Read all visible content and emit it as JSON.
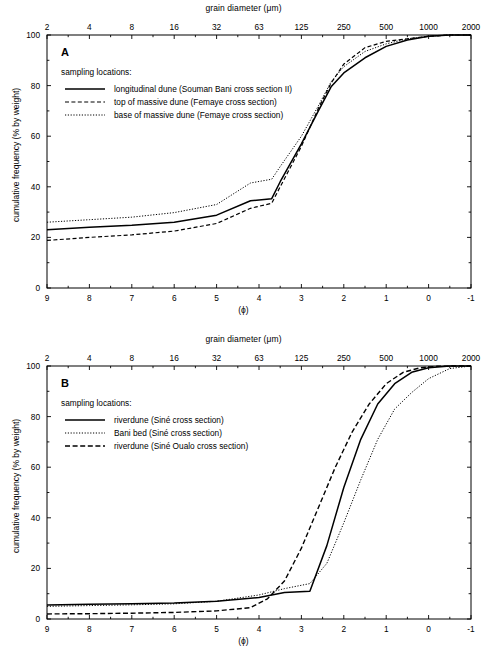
{
  "figure": {
    "top_axis_title": "grain diameter (μm)",
    "bottom_axis_title": "(ϕ)",
    "y_axis_title": "cumulative frequency (% by weight)",
    "legend_header": "sampling locations:"
  },
  "chart_data": [
    {
      "type": "line",
      "panel": "A",
      "title": "grain diameter (μm)",
      "xlabel": "(ϕ)",
      "ylabel": "cumulative frequency (% by weight)",
      "xlim": [
        9,
        -1
      ],
      "ylim": [
        0,
        100
      ],
      "grid": false,
      "legend_position": "upper-left",
      "x_ticks_bottom": [
        "9",
        "8",
        "7",
        "6",
        "5",
        "4",
        "3",
        "2",
        "1",
        "0",
        "-1"
      ],
      "x_ticks_top": [
        "2",
        "4",
        "8",
        "16",
        "32",
        "63",
        "125",
        "250",
        "500",
        "1000",
        "2000"
      ],
      "y_ticks": [
        "0",
        "20",
        "40",
        "60",
        "80",
        "100"
      ],
      "y_minor_ticks": [
        10,
        30,
        50,
        70,
        90
      ],
      "series": [
        {
          "name": "longitudinal dune (Souman Bani cross section II)",
          "style": "solid",
          "x": [
            9.0,
            8.0,
            7.0,
            6.0,
            5.0,
            4.2,
            3.7,
            3.5,
            3.0,
            2.6,
            2.3,
            2.0,
            1.5,
            1.0,
            0.5,
            0.0,
            -0.5,
            -1.0
          ],
          "y": [
            23.0,
            24.0,
            24.8,
            26.0,
            28.8,
            34.5,
            35.3,
            42.0,
            57.0,
            70.0,
            79.5,
            85.0,
            91.0,
            95.5,
            98.0,
            99.5,
            100.0,
            100.0
          ]
        },
        {
          "name": "top of massive dune (Femaye cross section)",
          "style": "dashed",
          "x": [
            9.0,
            8.0,
            7.0,
            6.0,
            5.0,
            4.2,
            3.7,
            3.5,
            3.0,
            2.6,
            2.3,
            2.0,
            1.5,
            1.0,
            0.5,
            0.0,
            -0.5,
            -1.0
          ],
          "y": [
            18.8,
            20.0,
            21.0,
            22.5,
            25.5,
            31.5,
            33.5,
            40.0,
            56.0,
            71.0,
            81.0,
            88.5,
            95.0,
            97.5,
            98.5,
            99.5,
            100.0,
            100.0
          ]
        },
        {
          "name": "base of massive dune (Femaye cross section)",
          "style": "dotted",
          "x": [
            9.0,
            8.0,
            7.0,
            6.0,
            5.0,
            4.2,
            3.7,
            3.5,
            3.0,
            2.6,
            2.3,
            2.0,
            1.5,
            1.0,
            0.5,
            0.0,
            -0.5,
            -1.0
          ],
          "y": [
            26.0,
            27.0,
            28.0,
            29.8,
            33.0,
            41.5,
            43.0,
            48.0,
            60.0,
            72.0,
            81.5,
            87.5,
            93.5,
            96.5,
            98.5,
            99.5,
            100.0,
            100.0
          ]
        }
      ]
    },
    {
      "type": "line",
      "panel": "B",
      "title": "grain diameter (μm)",
      "xlabel": "(ϕ)",
      "ylabel": "cumulative frequency (% by weight)",
      "xlim": [
        9,
        -1
      ],
      "ylim": [
        0,
        100
      ],
      "grid": false,
      "legend_position": "upper-left",
      "x_ticks_bottom": [
        "9",
        "8",
        "7",
        "6",
        "5",
        "4",
        "3",
        "2",
        "1",
        "0",
        "-1"
      ],
      "x_ticks_top": [
        "2",
        "4",
        "8",
        "16",
        "32",
        "63",
        "125",
        "250",
        "500",
        "1000",
        "2000"
      ],
      "y_ticks": [
        "0",
        "20",
        "40",
        "60",
        "80",
        "100"
      ],
      "y_minor_ticks": [
        10,
        30,
        50,
        70,
        90
      ],
      "series": [
        {
          "name": "riverdune (Siné cross section)",
          "style": "solid",
          "x": [
            9.0,
            8.0,
            7.0,
            6.0,
            5.0,
            4.0,
            3.4,
            2.8,
            2.4,
            2.0,
            1.6,
            1.2,
            0.8,
            0.4,
            0.0,
            -0.5,
            -1.0
          ],
          "y": [
            5.5,
            5.8,
            6.0,
            6.3,
            7.0,
            8.5,
            10.5,
            11.0,
            29.0,
            52.0,
            71.0,
            85.0,
            93.0,
            97.5,
            99.3,
            100.0,
            100.0
          ]
        },
        {
          "name": "Bani bed (Siné cross section)",
          "style": "dotted",
          "x": [
            9.0,
            8.0,
            7.0,
            6.0,
            5.0,
            4.0,
            3.4,
            2.8,
            2.4,
            2.0,
            1.6,
            1.2,
            0.8,
            0.4,
            0.0,
            -0.5,
            -1.0
          ],
          "y": [
            5.0,
            5.3,
            5.6,
            6.0,
            7.0,
            9.5,
            12.0,
            14.0,
            22.0,
            38.0,
            55.0,
            71.0,
            83.0,
            89.5,
            95.0,
            99.0,
            100.0
          ]
        },
        {
          "name": "riverdune (Siné Oualo cross section)",
          "style": "dashed-long",
          "x": [
            9.0,
            8.0,
            7.0,
            6.0,
            5.0,
            4.2,
            3.8,
            3.4,
            3.0,
            2.6,
            2.2,
            1.8,
            1.4,
            1.0,
            0.6,
            0.2,
            -0.2,
            -0.6,
            -1.0
          ],
          "y": [
            2.0,
            2.1,
            2.3,
            2.6,
            3.2,
            4.5,
            8.0,
            15.0,
            28.0,
            44.0,
            60.0,
            74.0,
            85.0,
            93.0,
            97.5,
            99.3,
            99.9,
            100.0,
            100.0
          ]
        }
      ]
    }
  ],
  "panels": [
    {
      "letter": "A",
      "legend_header": "sampling locations:",
      "legend": [
        {
          "label": "longitudinal dune (Souman Bani cross section II)",
          "style": "solid"
        },
        {
          "label": "top of massive dune (Femaye cross section)",
          "style": "dashed"
        },
        {
          "label": "base of massive dune (Femaye cross section)",
          "style": "dotted"
        }
      ]
    },
    {
      "letter": "B",
      "legend_header": "sampling locations:",
      "legend": [
        {
          "label": "riverdune (Siné cross section)",
          "style": "solid"
        },
        {
          "label": "Bani bed (Siné cross section)",
          "style": "dotted"
        },
        {
          "label": "riverdune (Siné Oualo cross section)",
          "style": "dashed-long"
        }
      ]
    }
  ]
}
